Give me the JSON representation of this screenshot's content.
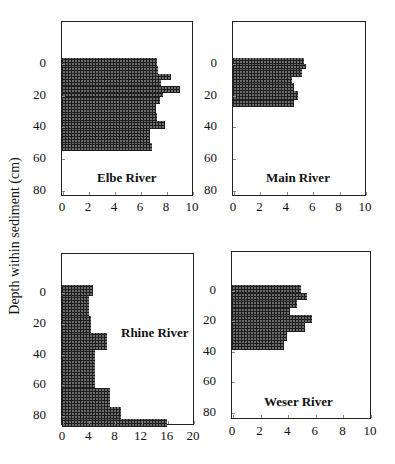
{
  "figure": {
    "ylabel": "Depth within sediment (cm)"
  },
  "chart_data": [
    {
      "type": "bar",
      "orientation": "horizontal",
      "title": "Elbe River",
      "xlabel": "",
      "ylabel": "Depth within sediment (cm)",
      "xlim": [
        0,
        10
      ],
      "ylim": [
        80,
        -25
      ],
      "xticks": [
        "0",
        "2",
        "4",
        "6",
        "8",
        "10"
      ],
      "yticks": [
        "0",
        "20",
        "40",
        "60",
        "80"
      ],
      "grid": false,
      "depth_from": [
        -4,
        1,
        6,
        10,
        14,
        18,
        21,
        25,
        31,
        36,
        41,
        50
      ],
      "depth_to": [
        1,
        6,
        10,
        14,
        18,
        21,
        25,
        31,
        36,
        41,
        50,
        55
      ],
      "values": [
        7.3,
        7.4,
        8.4,
        7.6,
        9.1,
        7.8,
        7.5,
        7.2,
        7.3,
        7.9,
        6.8,
        6.9
      ]
    },
    {
      "type": "bar",
      "orientation": "horizontal",
      "title": "Main River",
      "xlabel": "",
      "ylabel": "Depth within sediment (cm)",
      "xlim": [
        0,
        10
      ],
      "ylim": [
        80,
        -25
      ],
      "xticks": [
        "0",
        "2",
        "4",
        "6",
        "8",
        "10"
      ],
      "yticks": [
        "0",
        "20",
        "40",
        "60",
        "80"
      ],
      "grid": false,
      "depth_from": [
        -4,
        0,
        3,
        8,
        12,
        17,
        23
      ],
      "depth_to": [
        0,
        3,
        8,
        12,
        17,
        23,
        27
      ],
      "values": [
        5.4,
        5.5,
        5.2,
        4.5,
        4.6,
        4.9,
        4.6
      ]
    },
    {
      "type": "bar",
      "orientation": "horizontal",
      "title": "Rhine River",
      "xlabel": "",
      "ylabel": "Depth within sediment (cm)",
      "xlim": [
        0,
        20
      ],
      "ylim": [
        85,
        -25
      ],
      "xticks": [
        "0",
        "4",
        "8",
        "12",
        "16",
        "20"
      ],
      "yticks": [
        "0",
        "20",
        "40",
        "60",
        "80"
      ],
      "grid": false,
      "depth_from": [
        -5,
        2,
        15,
        26,
        37,
        62,
        74,
        82
      ],
      "depth_to": [
        2,
        15,
        26,
        37,
        62,
        74,
        82,
        87
      ],
      "values": [
        4.7,
        4.1,
        4.4,
        6.9,
        5.0,
        7.3,
        9.0,
        16.0
      ]
    },
    {
      "type": "bar",
      "orientation": "horizontal",
      "title": "Weser River",
      "xlabel": "",
      "ylabel": "Depth within sediment (cm)",
      "xlim": [
        0,
        10
      ],
      "ylim": [
        85,
        -25
      ],
      "xticks": [
        "0",
        "2",
        "4",
        "6",
        "8",
        "10"
      ],
      "yticks": [
        "0",
        "20",
        "40",
        "60",
        "80"
      ],
      "grid": false,
      "depth_from": [
        -4,
        1,
        6,
        11,
        16,
        21,
        27,
        33
      ],
      "depth_to": [
        1,
        6,
        11,
        16,
        21,
        27,
        33,
        39
      ],
      "values": [
        5.0,
        5.4,
        4.7,
        4.2,
        5.8,
        5.3,
        4.0,
        3.8
      ]
    }
  ]
}
